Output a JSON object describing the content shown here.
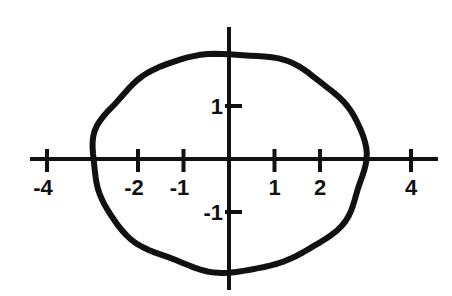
{
  "chart_data": {
    "type": "line",
    "title": "",
    "xlabel": "",
    "ylabel": "",
    "curve": "ellipse",
    "ellipse": {
      "center": [
        0,
        0
      ],
      "semi_axis_x": 3,
      "semi_axis_y": 2
    },
    "x_ticks": [
      -4,
      -2,
      -1,
      1,
      2,
      4
    ],
    "x_tick_labels": [
      "-4",
      "-2",
      "-1",
      "1",
      "2",
      "4"
    ],
    "y_ticks": [
      1,
      -1
    ],
    "y_tick_labels": [
      "1",
      "-1"
    ],
    "xlim": [
      -4.4,
      4.6
    ],
    "ylim": [
      -2.5,
      2.5
    ],
    "grid": false,
    "legend": null
  },
  "colors": {
    "curve": "#111111",
    "axes": "#111111",
    "background": "#ffffff"
  }
}
